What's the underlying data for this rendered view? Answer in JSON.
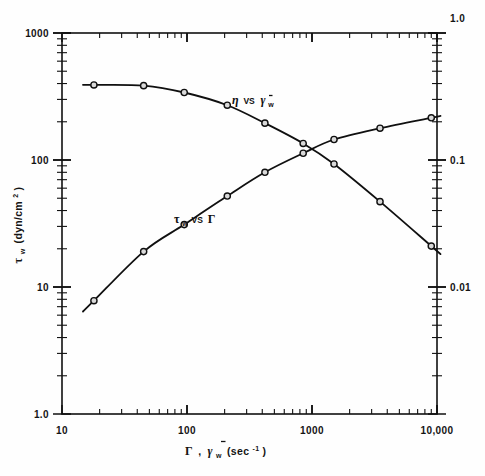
{
  "figure": {
    "background": "#fefefe",
    "frame_color": "#111111",
    "curve_color": "#101010",
    "marker_fill": "#d9d9d9"
  },
  "axes": {
    "x": {
      "label_parts": {
        "gamma_dot": "Γ",
        "comma": ",",
        "gammaw": "γ",
        "sub_w": "w",
        "units_open": "(sec",
        "sup": "-1",
        "units_close": ")"
      },
      "label_plain": "Γ , γ̇w (sec-1)",
      "ticks": [
        "10",
        "100",
        "1000",
        "10,000"
      ],
      "range": [
        10,
        10000
      ],
      "scale": "log"
    },
    "y_left": {
      "label_parts": {
        "tau": "τ",
        "sub_w": "w",
        "units_open": "(dyn/cm",
        "sup": "2",
        "units_close": ")"
      },
      "label_plain": "τw (dyn/cm2)",
      "ticks": [
        "1000",
        "100",
        "10",
        "1.0"
      ],
      "range": [
        1.0,
        1000
      ],
      "scale": "log"
    },
    "y_right": {
      "label_plain": "",
      "ticks": [
        "1.0",
        "0.1",
        "0.01"
      ],
      "range": [
        0.001,
        1.0
      ],
      "scale": "log"
    }
  },
  "annotations": [
    {
      "id": "eta-curve-label",
      "text_plain": "η vs γ̇w",
      "eta": "η",
      "vs": "VS",
      "gamma": "γ",
      "sub": "w",
      "x": 232,
      "y": 104
    },
    {
      "id": "tau-curve-label",
      "text_plain": "τw vs Γ",
      "tau": "τ",
      "sub": "w",
      "vs": "VS",
      "gamma_big": "Γ",
      "x": 174,
      "y": 223
    }
  ],
  "chart_data": {
    "type": "line",
    "title": "",
    "subtitle": "",
    "xlabel": "Γ , γ̇w (sec-1)",
    "ylabel": "τw (dyn/cm2)",
    "ylabel_right": "",
    "xscale": "log",
    "yscale": "log",
    "xlim": [
      10,
      10000
    ],
    "ylim": [
      1.0,
      1000
    ],
    "ylim_right": [
      0.001,
      1.0
    ],
    "grid": false,
    "legend": "inline-annotations",
    "legend_position": "inline",
    "series": [
      {
        "name": "τw vs Γ",
        "axis": "left",
        "marker": "open-circle",
        "x": [
          18,
          45,
          95,
          210,
          420,
          850,
          1500,
          3500,
          9000
        ],
        "values": [
          7.8,
          19,
          31,
          52,
          80,
          113,
          145,
          178,
          215
        ]
      },
      {
        "name": "η vs γ̇w",
        "axis": "right",
        "marker": "open-circle",
        "x": [
          18,
          45,
          95,
          210,
          420,
          850,
          1500,
          3500,
          9000
        ],
        "values": [
          0.39,
          0.385,
          0.34,
          0.27,
          0.195,
          0.135,
          0.093,
          0.047,
          0.021
        ]
      }
    ]
  }
}
